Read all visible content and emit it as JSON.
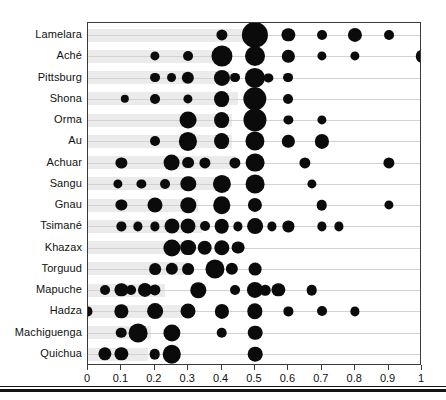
{
  "chart_data": {
    "type": "scatter",
    "title": "",
    "subtitle": "",
    "xlabel": "",
    "ylabel": "",
    "xlim": [
      0,
      1
    ],
    "ylim_categories_order": "top-to-bottom",
    "grid": true,
    "legend": "none",
    "note": "Bubble/dot plot: one horizontal row per society; bubble x-position is the offer value and bubble area encodes the proportion of players making that offer.",
    "xticks": [
      0,
      0.1,
      0.2,
      0.3,
      0.4,
      0.5,
      0.6,
      0.7,
      0.8,
      0.9,
      1
    ],
    "xticklabels": [
      "0",
      "0.1",
      "0.2",
      "0.3",
      "0.4",
      "0.5",
      "0.6",
      "0.7",
      "0.8",
      "0.9",
      "1"
    ],
    "categories": [
      "Lamelara",
      "Aché",
      "Pittsburg",
      "Shona",
      "Orma",
      "Au",
      "Achuar",
      "Sangu",
      "Gnau",
      "Tsimané",
      "Khazax",
      "Torguud",
      "Mapuche",
      "Hadza",
      "Machiguenga",
      "Quichua"
    ],
    "colors": {
      "bubble": "#0b0b0b",
      "band": "#ebebeb",
      "rowline": "#d2d2d2",
      "frame": "#3a3a3a",
      "text": "#111111",
      "background": "#ffffff"
    },
    "series": [
      {
        "name": "Lamelara",
        "band_end": 0.54,
        "points": [
          {
            "x": 0.4,
            "size": 0.07
          },
          {
            "x": 0.5,
            "size": 0.56
          },
          {
            "x": 0.6,
            "size": 0.11
          },
          {
            "x": 0.7,
            "size": 0.05
          },
          {
            "x": 0.8,
            "size": 0.13
          },
          {
            "x": 0.9,
            "size": 0.05
          }
        ]
      },
      {
        "name": "Aché",
        "band_end": 0.42,
        "points": [
          {
            "x": 0.2,
            "size": 0.04
          },
          {
            "x": 0.3,
            "size": 0.05
          },
          {
            "x": 0.4,
            "size": 0.34
          },
          {
            "x": 0.5,
            "size": 0.3
          },
          {
            "x": 0.6,
            "size": 0.09
          },
          {
            "x": 0.7,
            "size": 0.04
          },
          {
            "x": 0.8,
            "size": 0.04
          },
          {
            "x": 1.0,
            "size": 0.09
          }
        ]
      },
      {
        "name": "Pittsburg",
        "band_end": 0.43,
        "points": [
          {
            "x": 0.2,
            "size": 0.05
          },
          {
            "x": 0.25,
            "size": 0.05
          },
          {
            "x": 0.3,
            "size": 0.09
          },
          {
            "x": 0.4,
            "size": 0.18
          },
          {
            "x": 0.44,
            "size": 0.05
          },
          {
            "x": 0.5,
            "size": 0.31
          },
          {
            "x": 0.54,
            "size": 0.04
          },
          {
            "x": 0.6,
            "size": 0.05
          }
        ]
      },
      {
        "name": "Shona",
        "band_end": 0.45,
        "points": [
          {
            "x": 0.11,
            "size": 0.03
          },
          {
            "x": 0.2,
            "size": 0.05
          },
          {
            "x": 0.3,
            "size": 0.04
          },
          {
            "x": 0.4,
            "size": 0.17
          },
          {
            "x": 0.5,
            "size": 0.43
          },
          {
            "x": 0.6,
            "size": 0.05
          }
        ]
      },
      {
        "name": "Orma",
        "band_end": 0.43,
        "points": [
          {
            "x": 0.3,
            "size": 0.2
          },
          {
            "x": 0.4,
            "size": 0.17
          },
          {
            "x": 0.5,
            "size": 0.42
          },
          {
            "x": 0.6,
            "size": 0.04
          },
          {
            "x": 0.7,
            "size": 0.04
          }
        ]
      },
      {
        "name": "Au",
        "band_end": 0.43,
        "points": [
          {
            "x": 0.2,
            "size": 0.05
          },
          {
            "x": 0.3,
            "size": 0.24
          },
          {
            "x": 0.4,
            "size": 0.17
          },
          {
            "x": 0.5,
            "size": 0.27
          },
          {
            "x": 0.6,
            "size": 0.09
          },
          {
            "x": 0.7,
            "size": 0.13
          }
        ]
      },
      {
        "name": "Achuar",
        "band_end": 0.44,
        "points": [
          {
            "x": 0.1,
            "size": 0.07
          },
          {
            "x": 0.25,
            "size": 0.2
          },
          {
            "x": 0.3,
            "size": 0.08
          },
          {
            "x": 0.35,
            "size": 0.07
          },
          {
            "x": 0.44,
            "size": 0.07
          },
          {
            "x": 0.5,
            "size": 0.26
          },
          {
            "x": 0.65,
            "size": 0.07
          },
          {
            "x": 0.9,
            "size": 0.07
          }
        ]
      },
      {
        "name": "Sangu",
        "band_end": 0.38,
        "points": [
          {
            "x": 0.09,
            "size": 0.04
          },
          {
            "x": 0.16,
            "size": 0.04
          },
          {
            "x": 0.23,
            "size": 0.05
          },
          {
            "x": 0.3,
            "size": 0.16
          },
          {
            "x": 0.4,
            "size": 0.24
          },
          {
            "x": 0.5,
            "size": 0.26
          },
          {
            "x": 0.67,
            "size": 0.04
          }
        ]
      },
      {
        "name": "Gnau",
        "band_end": 0.33,
        "points": [
          {
            "x": 0.1,
            "size": 0.07
          },
          {
            "x": 0.2,
            "size": 0.15
          },
          {
            "x": 0.3,
            "size": 0.16
          },
          {
            "x": 0.4,
            "size": 0.22
          },
          {
            "x": 0.5,
            "size": 0.13
          },
          {
            "x": 0.7,
            "size": 0.06
          },
          {
            "x": 0.9,
            "size": 0.04
          }
        ]
      },
      {
        "name": "Tsimané",
        "band_end": 0.34,
        "points": [
          {
            "x": 0.1,
            "size": 0.04
          },
          {
            "x": 0.15,
            "size": 0.04
          },
          {
            "x": 0.2,
            "size": 0.04
          },
          {
            "x": 0.25,
            "size": 0.15
          },
          {
            "x": 0.3,
            "size": 0.15
          },
          {
            "x": 0.35,
            "size": 0.05
          },
          {
            "x": 0.4,
            "size": 0.14
          },
          {
            "x": 0.45,
            "size": 0.04
          },
          {
            "x": 0.5,
            "size": 0.17
          },
          {
            "x": 0.55,
            "size": 0.04
          },
          {
            "x": 0.6,
            "size": 0.07
          },
          {
            "x": 0.7,
            "size": 0.04
          },
          {
            "x": 0.75,
            "size": 0.04
          }
        ]
      },
      {
        "name": "Khazax",
        "band_end": 0.3,
        "points": [
          {
            "x": 0.25,
            "size": 0.21
          },
          {
            "x": 0.3,
            "size": 0.17
          },
          {
            "x": 0.35,
            "size": 0.14
          },
          {
            "x": 0.4,
            "size": 0.16
          },
          {
            "x": 0.45,
            "size": 0.1
          }
        ]
      },
      {
        "name": "Torguud",
        "band_end": 0.3,
        "points": [
          {
            "x": 0.2,
            "size": 0.08
          },
          {
            "x": 0.25,
            "size": 0.09
          },
          {
            "x": 0.3,
            "size": 0.08
          },
          {
            "x": 0.38,
            "size": 0.27
          },
          {
            "x": 0.43,
            "size": 0.09
          },
          {
            "x": 0.5,
            "size": 0.1
          }
        ]
      },
      {
        "name": "Mapuche",
        "band_end": 0.23,
        "points": [
          {
            "x": 0.05,
            "size": 0.05
          },
          {
            "x": 0.1,
            "size": 0.11
          },
          {
            "x": 0.13,
            "size": 0.05
          },
          {
            "x": 0.17,
            "size": 0.13
          },
          {
            "x": 0.2,
            "size": 0.07
          },
          {
            "x": 0.33,
            "size": 0.16
          },
          {
            "x": 0.44,
            "size": 0.05
          },
          {
            "x": 0.5,
            "size": 0.18
          },
          {
            "x": 0.53,
            "size": 0.06
          },
          {
            "x": 0.57,
            "size": 0.11
          },
          {
            "x": 0.67,
            "size": 0.06
          }
        ]
      },
      {
        "name": "Hadza",
        "band_end": 0.28,
        "points": [
          {
            "x": 0.0,
            "size": 0.04
          },
          {
            "x": 0.1,
            "size": 0.11
          },
          {
            "x": 0.2,
            "size": 0.17
          },
          {
            "x": 0.3,
            "size": 0.15
          },
          {
            "x": 0.4,
            "size": 0.13
          },
          {
            "x": 0.5,
            "size": 0.16
          },
          {
            "x": 0.6,
            "size": 0.04
          },
          {
            "x": 0.7,
            "size": 0.05
          },
          {
            "x": 0.8,
            "size": 0.04
          }
        ]
      },
      {
        "name": "Machiguenga",
        "band_end": 0.19,
        "points": [
          {
            "x": 0.1,
            "size": 0.06
          },
          {
            "x": 0.15,
            "size": 0.26
          },
          {
            "x": 0.25,
            "size": 0.21
          },
          {
            "x": 0.4,
            "size": 0.06
          },
          {
            "x": 0.5,
            "size": 0.14
          }
        ]
      },
      {
        "name": "Quichua",
        "band_end": 0.18,
        "points": [
          {
            "x": 0.05,
            "size": 0.11
          },
          {
            "x": 0.1,
            "size": 0.11
          },
          {
            "x": 0.2,
            "size": 0.06
          },
          {
            "x": 0.25,
            "size": 0.25
          },
          {
            "x": 0.5,
            "size": 0.14
          }
        ]
      }
    ]
  }
}
